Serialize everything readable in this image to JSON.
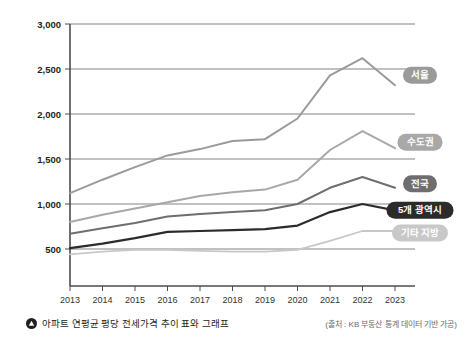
{
  "chart_data": {
    "type": "line",
    "title": "",
    "xlabel": "",
    "ylabel": "",
    "categories": [
      "2013",
      "2014",
      "2015",
      "2016",
      "2017",
      "2018",
      "2019",
      "2020",
      "2021",
      "2022",
      "2023"
    ],
    "ylim": [
      0,
      3000
    ],
    "yticks": [
      500,
      1000,
      1500,
      2000,
      2500,
      3000
    ],
    "ytick_labels": [
      "500",
      "1,000",
      "1,500",
      "2,000",
      "2,500",
      "3,000"
    ],
    "grid": true,
    "legend_position": "right-inline-badges",
    "series": [
      {
        "name": "서울",
        "color": "#9a9a9a",
        "values": [
          1120,
          1270,
          1410,
          1540,
          1610,
          1700,
          1720,
          1950,
          2430,
          2620,
          2320
        ]
      },
      {
        "name": "수도권",
        "color": "#a8a8a8",
        "values": [
          800,
          880,
          950,
          1020,
          1090,
          1130,
          1160,
          1270,
          1600,
          1810,
          1620
        ]
      },
      {
        "name": "전국",
        "color": "#6e6e6e",
        "values": [
          670,
          730,
          790,
          860,
          890,
          910,
          930,
          1000,
          1180,
          1300,
          1180
        ]
      },
      {
        "name": "5개 광역시",
        "color": "#2b2b2b",
        "values": [
          510,
          560,
          620,
          690,
          700,
          710,
          720,
          760,
          910,
          1000,
          930
        ]
      },
      {
        "name": "기타 지방",
        "color": "#c8c8c8",
        "values": [
          440,
          470,
          490,
          490,
          480,
          470,
          470,
          490,
          590,
          700,
          700
        ]
      }
    ],
    "annotations": {
      "caption": "아파트 연평균 평당 전세가격 추이 표와 그래프",
      "caption_icon": "triangle-up-circle-icon",
      "source": "(출처 : KB 부동산 통계 데이터 기반 가공)"
    },
    "colors": {
      "axis": "#4d4d4d",
      "grid": "#4d4d4d",
      "background": "#ffffff",
      "text": "#231f20",
      "source_text": "#6b6b6b"
    }
  }
}
